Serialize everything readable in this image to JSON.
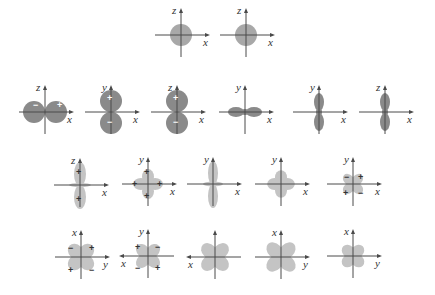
{
  "colors": {
    "lobe_dark": "#8a8a8a",
    "lobe_medium": "#a8a8a8",
    "lobe_light": "#c4c4c4",
    "axis": "#4a4a4a"
  },
  "diagrams": [
    {
      "id": "s-1",
      "cx": 181,
      "cy": 35,
      "shape": "sphere",
      "r": 11,
      "vlabel": "z",
      "hlabel": "x",
      "harrow": "right",
      "fill": "lobe_medium",
      "signs": []
    },
    {
      "id": "s-2",
      "cx": 246,
      "cy": 35,
      "shape": "sphere",
      "r": 11,
      "vlabel": "z",
      "hlabel": "x",
      "harrow": "right",
      "fill": "lobe_medium",
      "signs": []
    },
    {
      "id": "p-x",
      "cx": 45,
      "cy": 112,
      "shape": "p-horizontal",
      "r": 11,
      "d": 11,
      "vlabel": "z",
      "hlabel": "x",
      "harrow": "right",
      "fill": "lobe_dark",
      "signs": [
        {
          "t": "−",
          "dx": -12,
          "dy": -4
        },
        {
          "t": "+",
          "dx": 12,
          "dy": -4
        }
      ]
    },
    {
      "id": "p-y",
      "cx": 111,
      "cy": 112,
      "shape": "p-vertical",
      "r": 11,
      "d": 11,
      "vlabel": "y",
      "hlabel": "x",
      "harrow": "right",
      "fill": "lobe_dark",
      "signs": [
        {
          "t": "+",
          "dx": -4,
          "dy": -11
        },
        {
          "t": "−",
          "dx": -4,
          "dy": 13
        }
      ]
    },
    {
      "id": "p-z",
      "cx": 177,
      "cy": 112,
      "shape": "p-vertical",
      "r": 11,
      "d": 11,
      "vlabel": "z",
      "hlabel": "x",
      "harrow": "right",
      "fill": "lobe_dark",
      "signs": [
        {
          "t": "+",
          "dx": -4,
          "dy": -11
        },
        {
          "t": "−",
          "dx": -4,
          "dy": 13
        }
      ]
    },
    {
      "id": "p-x-elongated",
      "cx": 245,
      "cy": 112,
      "shape": "dumbbell-h",
      "rx": 8,
      "ry": 5,
      "d": 9,
      "vlabel": "y",
      "hlabel": "x",
      "harrow": "right",
      "fill": "lobe_dark",
      "signs": []
    },
    {
      "id": "p-y-elongated",
      "cx": 319,
      "cy": 112,
      "shape": "dumbbell-v",
      "rx": 5,
      "ry": 9,
      "d": 10,
      "vlabel": "y",
      "hlabel": "x",
      "harrow": "right",
      "fill": "lobe_dark",
      "signs": []
    },
    {
      "id": "p-z-elongated",
      "cx": 385,
      "cy": 112,
      "shape": "dumbbell-v",
      "rx": 5,
      "ry": 9,
      "d": 10,
      "vlabel": "z",
      "hlabel": "x",
      "harrow": "right",
      "fill": "lobe_dark",
      "signs": []
    },
    {
      "id": "d-z2",
      "cx": 80,
      "cy": 185,
      "shape": "dz2",
      "vlabel": "z",
      "hlabel": "x",
      "harrow": "right",
      "fill": "lobe_light",
      "signs": [
        {
          "t": "+",
          "dx": -4,
          "dy": -10
        },
        {
          "t": "+",
          "dx": -4,
          "dy": 17
        }
      ]
    },
    {
      "id": "d-cross-plus",
      "cx": 148,
      "cy": 184,
      "shape": "cross",
      "len": 13,
      "w": 6,
      "vlabel": "y",
      "hlabel": "x",
      "harrow": "right",
      "fill": "lobe_light",
      "signs": [
        {
          "t": "+",
          "dx": -4,
          "dy": -9
        },
        {
          "t": "+",
          "dx": -4,
          "dy": 15
        },
        {
          "t": "+",
          "dx": -16,
          "dy": 3
        },
        {
          "t": "+",
          "dx": 9,
          "dy": 3
        }
      ]
    },
    {
      "id": "d-vertical-ring",
      "cx": 213,
      "cy": 184,
      "shape": "dz2-narrow",
      "vlabel": "y",
      "hlabel": "x",
      "harrow": "right",
      "fill": "lobe_light",
      "signs": []
    },
    {
      "id": "d-cross",
      "cx": 281,
      "cy": 184,
      "shape": "cross",
      "len": 12,
      "w": 6,
      "vlabel": "y",
      "hlabel": "x",
      "harrow": "right",
      "fill": "lobe_light",
      "signs": []
    },
    {
      "id": "d-xy-signed",
      "cx": 353,
      "cy": 184,
      "shape": "clover",
      "len": 11,
      "w": 5,
      "vlabel": "y",
      "hlabel": "x",
      "harrow": "right",
      "fill": "lobe_light",
      "signs": [
        {
          "t": "−",
          "dx": -9,
          "dy": -4
        },
        {
          "t": "+",
          "dx": 5,
          "dy": -4
        },
        {
          "t": "+",
          "dx": -10,
          "dy": 12
        },
        {
          "t": "−",
          "dx": 5,
          "dy": 12
        }
      ]
    },
    {
      "id": "d-clover-xy-1",
      "cx": 81,
      "cy": 257,
      "shape": "clover",
      "len": 14,
      "w": 7,
      "vlabel": "x",
      "hlabel": "y",
      "harrow": "right",
      "fill": "lobe_light",
      "signs": [
        {
          "t": "−",
          "dx": -13,
          "dy": -6
        },
        {
          "t": "+",
          "dx": 8,
          "dy": -6
        },
        {
          "t": "+",
          "dx": -13,
          "dy": 16
        },
        {
          "t": "−",
          "dx": 8,
          "dy": 16
        }
      ]
    },
    {
      "id": "d-clover-xy-2",
      "cx": 148,
      "cy": 256,
      "shape": "clover",
      "len": 13,
      "w": 6,
      "vlabel": "y",
      "hlabel": "x",
      "harrow": "left",
      "fill": "lobe_light",
      "signs": [
        {
          "t": "+",
          "dx": -13,
          "dy": -6
        },
        {
          "t": "−",
          "dx": 7,
          "dy": -6
        },
        {
          "t": "−",
          "dx": -13,
          "dy": 15
        },
        {
          "t": "+",
          "dx": 7,
          "dy": 15
        }
      ]
    },
    {
      "id": "d-clover-3",
      "cx": 215,
      "cy": 257,
      "shape": "clover",
      "len": 15,
      "w": 7,
      "vlabel": "",
      "hlabel": "x",
      "harrow": "left",
      "fill": "lobe_light",
      "signs": []
    },
    {
      "id": "d-clover-4",
      "cx": 281,
      "cy": 257,
      "shape": "clover",
      "len": 16,
      "w": 7,
      "vlabel": "x",
      "hlabel": "y",
      "harrow": "right",
      "fill": "lobe_light",
      "signs": []
    },
    {
      "id": "d-clover-5",
      "cx": 353,
      "cy": 256,
      "shape": "clover",
      "len": 12,
      "w": 6,
      "vlabel": "x",
      "hlabel": "y",
      "harrow": "right",
      "fill": "lobe_light",
      "signs": []
    }
  ],
  "axis_extent": {
    "h": 26,
    "v_up": 24,
    "v_down": 22
  }
}
